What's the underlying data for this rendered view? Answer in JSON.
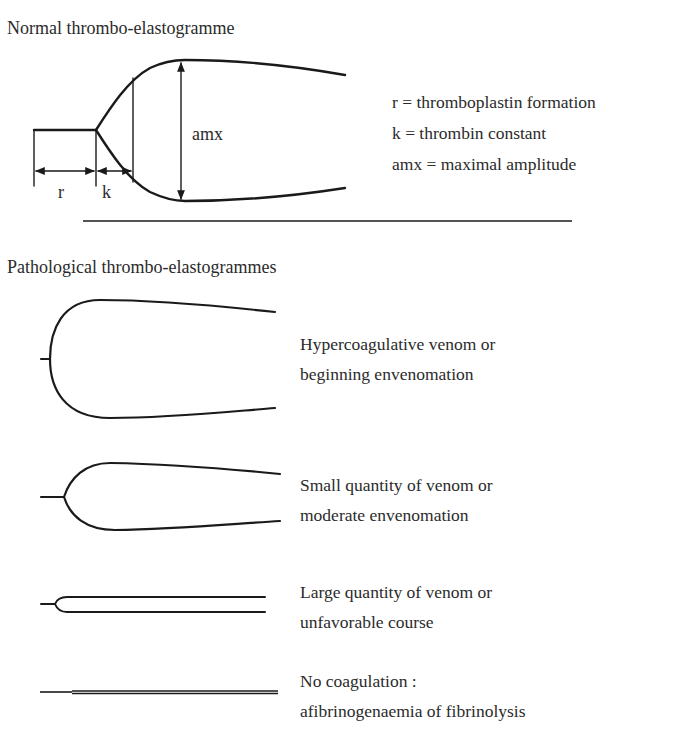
{
  "normal": {
    "title": "Normal thrombo-elastogramme",
    "labels": {
      "r": "r",
      "k": "k",
      "amx": "amx"
    },
    "legend": [
      "r = thromboplastin formation",
      "k = thrombin constant",
      "amx = maximal amplitude"
    ]
  },
  "pathological": {
    "title": "Pathological thrombo-elastogrammes",
    "items": [
      {
        "line1": "Hypercoagulative venom or",
        "line2": "beginning envenomation"
      },
      {
        "line1": "Small quantity of  venom or",
        "line2": "moderate envenomation"
      },
      {
        "line1": "Large quantity of  venom or",
        "line2": "unfavorable course"
      },
      {
        "line1": "No coagulation :",
        "line2": "afibrinogenaemia of  fibrinolysis"
      }
    ]
  },
  "colors": {
    "stroke": "#1a1a1a",
    "text": "#2b2b2b",
    "background": "#ffffff"
  }
}
